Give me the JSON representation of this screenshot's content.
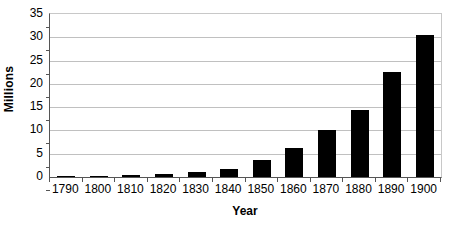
{
  "chart_data": {
    "type": "bar",
    "title": "",
    "subtitle": "",
    "xlabel": "Year",
    "ylabel": "Millions",
    "categories": [
      "1790",
      "1800",
      "1810",
      "1820",
      "1830",
      "1840",
      "1850",
      "1860",
      "1870",
      "1880",
      "1890",
      "1900"
    ],
    "values": [
      0.2,
      0.3,
      0.5,
      0.7,
      1.1,
      1.8,
      3.7,
      6.2,
      10.1,
      14.3,
      22.5,
      30.6
    ],
    "series": [
      {
        "name": "Millions",
        "values": [
          0.2,
          0.3,
          0.5,
          0.7,
          1.1,
          1.8,
          3.7,
          6.2,
          10.1,
          14.3,
          22.5,
          30.6
        ]
      }
    ],
    "ylim": [
      0,
      35
    ],
    "ytick_values": [
      0,
      5,
      10,
      15,
      20,
      25,
      30,
      35
    ],
    "ytick_labels": [
      "0",
      "5",
      "10",
      "15",
      "20",
      "25",
      "30",
      "35"
    ],
    "xtick_labels": [
      "1790",
      "1800",
      "1810",
      "1820",
      "1830",
      "1840",
      "1850",
      "1860",
      "1870",
      "1880",
      "1890",
      "1900"
    ],
    "grid": true,
    "grid_axis": "y",
    "legend": false,
    "legend_position": "none",
    "annotations": [],
    "colors": {
      "bar": "#000000",
      "grid": "#c0c0c0",
      "axis": "#555555",
      "plot_border": "#c8c8c8",
      "background": "#ffffff",
      "text": "#000000"
    }
  }
}
